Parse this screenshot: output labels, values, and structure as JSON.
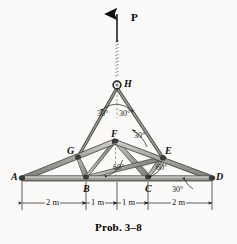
{
  "figure": {
    "caption": "Prob. 3–8",
    "type": "truss-free-body-diagram",
    "background_color": "#fbfaf8",
    "member_fill": "#9a9a96",
    "member_stroke": "#3a3a38",
    "line_color": "#1a1a1a"
  },
  "load": {
    "label": "P",
    "direction": "up",
    "applied_at_joint": "H"
  },
  "joints": [
    {
      "id": "A",
      "label": "A",
      "x": 22,
      "y": 178,
      "label_dx": -11,
      "label_dy": -6
    },
    {
      "id": "B",
      "label": "B",
      "x": 86,
      "y": 178,
      "label_dx": -3,
      "label_dy": 6
    },
    {
      "id": "C",
      "label": "C",
      "x": 148,
      "y": 178,
      "label_dx": -3,
      "label_dy": 6
    },
    {
      "id": "D",
      "label": "D",
      "x": 212,
      "y": 178,
      "label_dx": 4,
      "label_dy": -6
    },
    {
      "id": "E",
      "label": "E",
      "x": 163,
      "y": 158,
      "label_dx": 2,
      "label_dy": -12
    },
    {
      "id": "F",
      "label": "F",
      "x": 115,
      "y": 141,
      "label_dx": -4,
      "label_dy": -12
    },
    {
      "id": "G",
      "label": "G",
      "x": 78,
      "y": 157,
      "label_dx": -11,
      "label_dy": -6
    },
    {
      "id": "H",
      "label": "H",
      "x": 117,
      "y": 85,
      "label_dx": 7,
      "label_dy": -4
    }
  ],
  "angles": [
    {
      "value": "30°",
      "at": "H",
      "side": "left",
      "x": 99,
      "y": 110
    },
    {
      "value": "30°",
      "at": "H",
      "side": "right",
      "x": 121,
      "y": 110
    },
    {
      "value": "30°",
      "at": "F",
      "side": "right",
      "x": 136,
      "y": 137
    },
    {
      "value": "60°",
      "at": "B",
      "side": "right",
      "x": 117,
      "y": 168
    },
    {
      "value": "60°",
      "at": "C",
      "side": "right",
      "x": 159,
      "y": 168
    },
    {
      "value": "30°",
      "at": "D",
      "side": "below",
      "x": 175,
      "y": 186
    }
  ],
  "dimensions": [
    {
      "label": "2 m",
      "from": "A",
      "to": "B",
      "x1": 22,
      "x2": 86,
      "text_x": 54,
      "text_y": 203
    },
    {
      "label": "1 m",
      "from": "B",
      "to": "mid",
      "x1": 86,
      "x2": 117,
      "text_x": 101,
      "text_y": 203
    },
    {
      "label": "1 m",
      "from": "mid",
      "to": "C",
      "x1": 117,
      "x2": 148,
      "text_x": 132,
      "text_y": 203
    },
    {
      "label": "2 m",
      "from": "C",
      "to": "D",
      "x1": 148,
      "x2": 212,
      "text_x": 180,
      "text_y": 203
    }
  ],
  "dimension_line_y": 203,
  "members": [
    {
      "from": "A",
      "to": "G",
      "kind": "top-chord"
    },
    {
      "from": "G",
      "to": "F",
      "kind": "top-chord"
    },
    {
      "from": "F",
      "to": "E",
      "kind": "top-chord"
    },
    {
      "from": "E",
      "to": "D",
      "kind": "top-chord"
    },
    {
      "from": "A",
      "to": "B",
      "kind": "bottom-chord"
    },
    {
      "from": "B",
      "to": "C",
      "kind": "bottom-chord"
    },
    {
      "from": "C",
      "to": "D",
      "kind": "bottom-chord"
    },
    {
      "from": "G",
      "to": "B",
      "kind": "web"
    },
    {
      "from": "B",
      "to": "F",
      "kind": "web"
    },
    {
      "from": "F",
      "to": "C",
      "kind": "web"
    },
    {
      "from": "C",
      "to": "E",
      "kind": "web"
    },
    {
      "from": "B",
      "to": "E",
      "kind": "web"
    },
    {
      "from": "H",
      "to": "G",
      "kind": "cable"
    },
    {
      "from": "H",
      "to": "E",
      "kind": "cable"
    }
  ]
}
